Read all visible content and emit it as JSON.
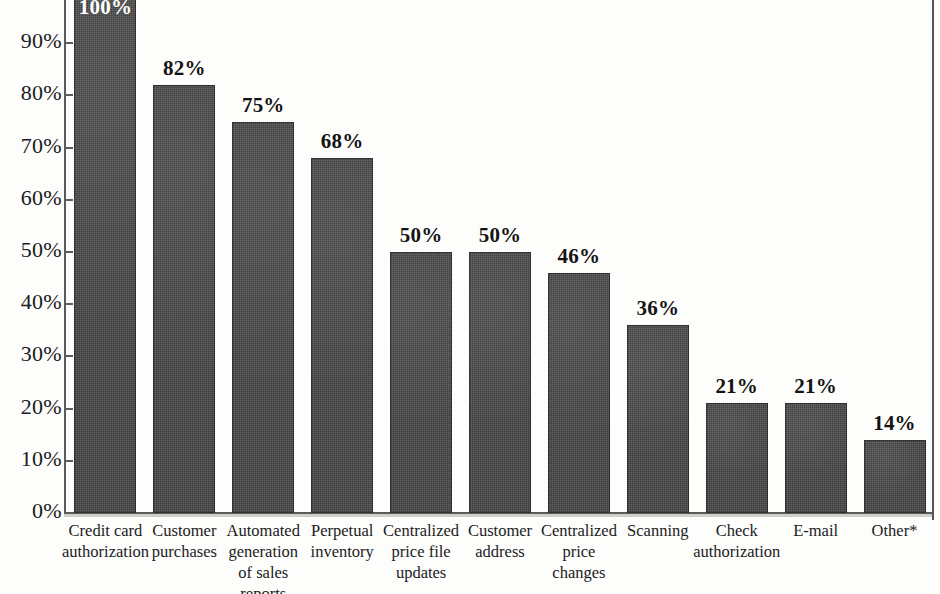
{
  "chart_data": {
    "type": "bar",
    "title": "",
    "subtitle": "",
    "xlabel": "",
    "ylabel": "",
    "ylim": [
      0,
      100
    ],
    "grid": false,
    "legend": null,
    "value_label_suffix": "%",
    "axis_tick_labels": [
      "100%",
      "90%",
      "80%",
      "70%",
      "60%",
      "50%",
      "40%",
      "30%",
      "20%",
      "10%",
      "0%"
    ],
    "axis_tick_values": [
      100,
      90,
      80,
      70,
      60,
      50,
      40,
      30,
      20,
      10,
      0
    ],
    "categories": [
      "Credit card\nauthorization",
      "Customer\npurchases",
      "Automated\ngeneration\nof sales\nreports",
      "Perpetual\ninventory",
      "Centralized\nprice file\nupdates",
      "Customer\naddress",
      "Centralized\nprice\nchanges",
      "Scanning",
      "Check\nauthorization",
      "E-mail",
      "Other*"
    ],
    "values": [
      100,
      82,
      75,
      68,
      50,
      50,
      46,
      36,
      21,
      21,
      14
    ],
    "value_labels": [
      "100%",
      "82%",
      "75%",
      "68%",
      "50%",
      "50%",
      "46%",
      "36%",
      "21%",
      "21%",
      "14%"
    ],
    "annotations": [
      "Other* category is footnoted with an asterisk"
    ],
    "bar_color": "#3b3b3b",
    "background_color": "#fdfdfb",
    "axis_color": "#5a5a5a"
  }
}
